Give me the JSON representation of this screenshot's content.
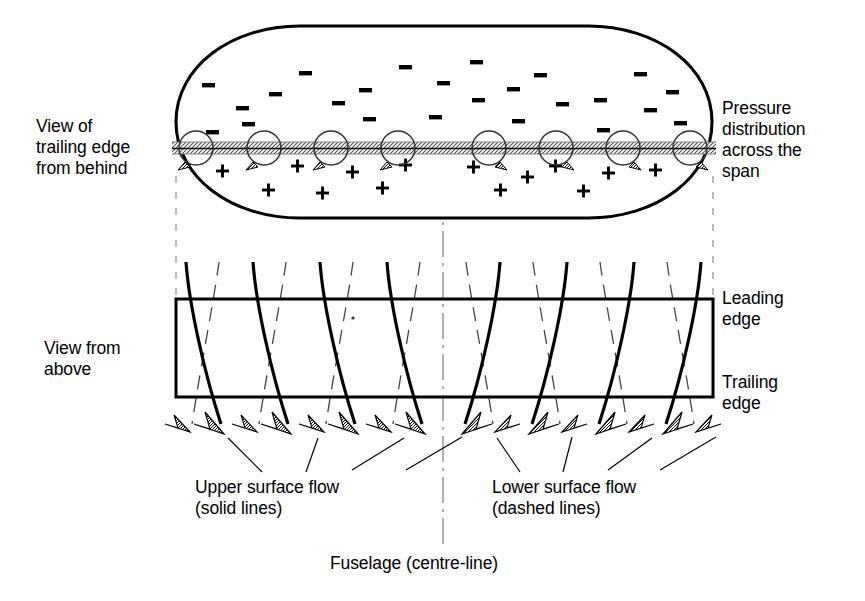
{
  "figure": {
    "type": "technical-diagram",
    "background_color": "#ffffff",
    "line_color": "#000000"
  },
  "labels": {
    "view_trailing_edge": "View of\ntrailing edge\nfrom behind",
    "pressure_distribution": "Pressure\ndistribution\nacross the\nspan",
    "view_from_above": "View from\nabove",
    "leading_edge": "Leading\nedge",
    "trailing_edge": "Trailing\nedge",
    "upper_surface_flow": "Upper surface flow\n(solid lines)",
    "lower_surface_flow": "Lower surface flow\n(dashed lines)",
    "fuselage_centreline": "Fuselage (centre-line)"
  },
  "diagram_data": {
    "centreline_x": 443,
    "span_left_x": 176,
    "span_right_x": 713,
    "upper_view": {
      "name": "rear-view-pressure-oval",
      "ellipse_cx": 444,
      "ellipse_cy": 122,
      "ellipse_rx": 268,
      "ellipse_ry": 96,
      "band_y": 148,
      "band_label": "trailing-edge-vortex-sheet",
      "vortex_count": 8,
      "vortex_radius": 17,
      "vortex_x": [
        196,
        264,
        331,
        398,
        489,
        556,
        623,
        690
      ],
      "vortex_rotation": [
        "ccw",
        "ccw",
        "ccw",
        "ccw",
        "cw",
        "cw",
        "cw",
        "cw"
      ],
      "minus_sign": "−",
      "plus_sign": "+",
      "minus_positions": [
        [
          212,
          133
        ],
        [
          242,
          109
        ],
        [
          208,
          86
        ],
        [
          275,
          95
        ],
        [
          248,
          125
        ],
        [
          305,
          74
        ],
        [
          338,
          104
        ],
        [
          365,
          91
        ],
        [
          369,
          120
        ],
        [
          405,
          68
        ],
        [
          443,
          84
        ],
        [
          435,
          118
        ],
        [
          476,
          63
        ],
        [
          478,
          101
        ],
        [
          513,
          90
        ],
        [
          518,
          122
        ],
        [
          540,
          76
        ],
        [
          562,
          105
        ],
        [
          600,
          101
        ],
        [
          603,
          131
        ],
        [
          640,
          75
        ],
        [
          650,
          111
        ],
        [
          672,
          93
        ],
        [
          680,
          124
        ]
      ],
      "plus_positions": [
        [
          222,
          171
        ],
        [
          268,
          190
        ],
        [
          297,
          166
        ],
        [
          322,
          193
        ],
        [
          352,
          172
        ],
        [
          382,
          188
        ],
        [
          405,
          165
        ],
        [
          473,
          167
        ],
        [
          500,
          190
        ],
        [
          527,
          177
        ],
        [
          555,
          166
        ],
        [
          583,
          191
        ],
        [
          608,
          173
        ],
        [
          655,
          170
        ]
      ]
    },
    "lower_view": {
      "name": "planform-flow-view",
      "box_left": 176,
      "box_right": 713,
      "box_top": 299,
      "box_bottom": 397,
      "solid_streamline_count": 8,
      "solid_streamline_top_x": [
        186,
        253,
        320,
        387,
        500,
        567,
        634,
        701
      ],
      "solid_streamline_tip_x": [
        224,
        291,
        358,
        425,
        462,
        529,
        596,
        663
      ],
      "dashed_streamline_count": 8,
      "dashed_streamline_top_x": [
        219,
        286,
        353,
        420,
        466,
        533,
        600,
        667
      ],
      "dashed_streamline_tip_x": [
        190,
        257,
        324,
        391,
        495,
        562,
        629,
        696
      ],
      "stream_top_y": 262,
      "arrow_tip_y": 432
    },
    "leaders": {
      "upper_flow": [
        [
          262,
          474,
          228,
          440
        ],
        [
          305,
          474,
          318,
          440
        ],
        [
          352,
          474,
          400,
          440
        ],
        [
          404,
          474,
          455,
          438
        ]
      ],
      "lower_flow": [
        [
          520,
          474,
          498,
          440
        ],
        [
          562,
          474,
          570,
          438
        ],
        [
          608,
          474,
          648,
          440
        ],
        [
          656,
          474,
          712,
          438
        ]
      ]
    }
  }
}
